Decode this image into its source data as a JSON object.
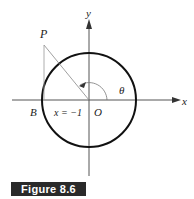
{
  "figure": {
    "caption": "Figure 8.6",
    "labels": {
      "y_axis": "y",
      "x_axis": "x",
      "point_p": "P",
      "point_b": "B",
      "origin": "O",
      "angle": "θ",
      "equation": "x = −1"
    }
  }
}
